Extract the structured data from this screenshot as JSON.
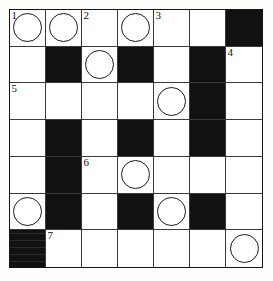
{
  "puzzle": {
    "type": "crossword-grid",
    "title": "",
    "rows": 7,
    "cols": 7,
    "cell_size_px": 36,
    "colors": {
      "block": "#111111",
      "cell": "#ffffff",
      "rule": "#3a3a3a",
      "border": "#141414",
      "number": "#111111",
      "circle": "#1a1a1a",
      "page": "#fdfdfb"
    },
    "legend": {
      "block_meaning": "blocked-square",
      "circle_meaning": "highlighted-letter-square",
      "number_meaning": "clue-entry-number"
    },
    "clue_numbers": [
      {
        "number": "1",
        "row": 1,
        "col": 1
      },
      {
        "number": "2",
        "row": 1,
        "col": 3
      },
      {
        "number": "3",
        "row": 1,
        "col": 5
      },
      {
        "number": "4",
        "row": 2,
        "col": 7
      },
      {
        "number": "5",
        "row": 3,
        "col": 1
      },
      {
        "number": "6",
        "row": 5,
        "col": 3
      },
      {
        "number": "7",
        "row": 7,
        "col": 2
      }
    ],
    "circled_cells": [
      {
        "row": 1,
        "col": 1
      },
      {
        "row": 1,
        "col": 2
      },
      {
        "row": 1,
        "col": 4
      },
      {
        "row": 2,
        "col": 3
      },
      {
        "row": 3,
        "col": 5
      },
      {
        "row": 5,
        "col": 4
      },
      {
        "row": 6,
        "col": 1
      },
      {
        "row": 6,
        "col": 5
      },
      {
        "row": 7,
        "col": 7
      }
    ],
    "blocked_cells": [
      {
        "row": 1,
        "col": 7
      },
      {
        "row": 2,
        "col": 2
      },
      {
        "row": 2,
        "col": 4
      },
      {
        "row": 2,
        "col": 6
      },
      {
        "row": 3,
        "col": 6
      },
      {
        "row": 4,
        "col": 2
      },
      {
        "row": 4,
        "col": 4
      },
      {
        "row": 4,
        "col": 6
      },
      {
        "row": 5,
        "col": 2
      },
      {
        "row": 6,
        "col": 2
      },
      {
        "row": 6,
        "col": 4
      },
      {
        "row": 6,
        "col": 6
      },
      {
        "row": 7,
        "col": 1
      }
    ],
    "grid": [
      [
        {
          "block": false,
          "number": "1",
          "circle": true,
          "letter": ""
        },
        {
          "block": false,
          "number": "",
          "circle": true,
          "letter": ""
        },
        {
          "block": false,
          "number": "2",
          "circle": false,
          "letter": ""
        },
        {
          "block": false,
          "number": "",
          "circle": true,
          "letter": ""
        },
        {
          "block": false,
          "number": "3",
          "circle": false,
          "letter": ""
        },
        {
          "block": false,
          "number": "",
          "circle": false,
          "letter": ""
        },
        {
          "block": true,
          "number": "",
          "circle": false,
          "letter": ""
        }
      ],
      [
        {
          "block": false,
          "number": "",
          "circle": false,
          "letter": ""
        },
        {
          "block": true,
          "number": "",
          "circle": false,
          "letter": ""
        },
        {
          "block": false,
          "number": "",
          "circle": true,
          "letter": ""
        },
        {
          "block": true,
          "number": "",
          "circle": false,
          "letter": ""
        },
        {
          "block": false,
          "number": "",
          "circle": false,
          "letter": ""
        },
        {
          "block": true,
          "number": "",
          "circle": false,
          "letter": ""
        },
        {
          "block": false,
          "number": "4",
          "circle": false,
          "letter": ""
        }
      ],
      [
        {
          "block": false,
          "number": "5",
          "circle": false,
          "letter": ""
        },
        {
          "block": false,
          "number": "",
          "circle": false,
          "letter": ""
        },
        {
          "block": false,
          "number": "",
          "circle": false,
          "letter": ""
        },
        {
          "block": false,
          "number": "",
          "circle": false,
          "letter": ""
        },
        {
          "block": false,
          "number": "",
          "circle": true,
          "letter": ""
        },
        {
          "block": true,
          "number": "",
          "circle": false,
          "letter": ""
        },
        {
          "block": false,
          "number": "",
          "circle": false,
          "letter": ""
        }
      ],
      [
        {
          "block": false,
          "number": "",
          "circle": false,
          "letter": ""
        },
        {
          "block": true,
          "number": "",
          "circle": false,
          "letter": ""
        },
        {
          "block": false,
          "number": "",
          "circle": false,
          "letter": ""
        },
        {
          "block": true,
          "number": "",
          "circle": false,
          "letter": ""
        },
        {
          "block": false,
          "number": "",
          "circle": false,
          "letter": ""
        },
        {
          "block": true,
          "number": "",
          "circle": false,
          "letter": ""
        },
        {
          "block": false,
          "number": "",
          "circle": false,
          "letter": ""
        }
      ],
      [
        {
          "block": false,
          "number": "",
          "circle": false,
          "letter": ""
        },
        {
          "block": true,
          "number": "",
          "circle": false,
          "letter": ""
        },
        {
          "block": false,
          "number": "6",
          "circle": false,
          "letter": ""
        },
        {
          "block": false,
          "number": "",
          "circle": true,
          "letter": ""
        },
        {
          "block": false,
          "number": "",
          "circle": false,
          "letter": ""
        },
        {
          "block": false,
          "number": "",
          "circle": false,
          "letter": ""
        },
        {
          "block": false,
          "number": "",
          "circle": false,
          "letter": ""
        }
      ],
      [
        {
          "block": false,
          "number": "",
          "circle": true,
          "letter": ""
        },
        {
          "block": true,
          "number": "",
          "circle": false,
          "letter": ""
        },
        {
          "block": false,
          "number": "",
          "circle": false,
          "letter": ""
        },
        {
          "block": true,
          "number": "",
          "circle": false,
          "letter": ""
        },
        {
          "block": false,
          "number": "",
          "circle": true,
          "letter": ""
        },
        {
          "block": true,
          "number": "",
          "circle": false,
          "letter": ""
        },
        {
          "block": false,
          "number": "",
          "circle": false,
          "letter": ""
        }
      ],
      [
        {
          "block": true,
          "number": "",
          "circle": false,
          "letter": "",
          "textured": true
        },
        {
          "block": false,
          "number": "7",
          "circle": false,
          "letter": ""
        },
        {
          "block": false,
          "number": "",
          "circle": false,
          "letter": ""
        },
        {
          "block": false,
          "number": "",
          "circle": false,
          "letter": ""
        },
        {
          "block": false,
          "number": "",
          "circle": false,
          "letter": ""
        },
        {
          "block": false,
          "number": "",
          "circle": false,
          "letter": ""
        },
        {
          "block": false,
          "number": "",
          "circle": true,
          "letter": ""
        }
      ]
    ]
  }
}
